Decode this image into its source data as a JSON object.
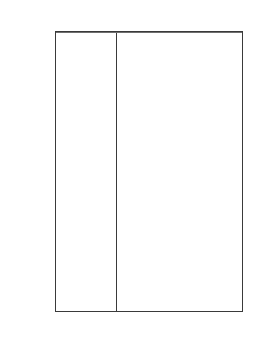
{
  "figure": {
    "top_artifact_text": "",
    "background_color": "#ffffff",
    "line_color": "#3a3a3a",
    "text_color": "#1a1a1a"
  },
  "axis": {
    "title": "Age  (million years)",
    "ticks": [
      {
        "label": "438",
        "value": 438
      },
      {
        "label": "505",
        "value": 505
      },
      {
        "label": "570",
        "value": 570
      }
    ],
    "range_top": 438,
    "range_bottom": 570,
    "direction": "increasing-downward"
  },
  "chart_data": {
    "type": "table",
    "title": "",
    "xlabel": "",
    "ylabel": "Age  (million years)",
    "ylim": [
      438,
      570
    ],
    "y_inverted": true,
    "grid": false,
    "legend": "none",
    "columns": [
      "Epoch",
      "Period"
    ],
    "periods": [
      {
        "name": "Ordovician",
        "top": 438,
        "bottom": 505
      },
      {
        "name": "Cambrian",
        "top": 505,
        "bottom": 570
      }
    ],
    "epochs": [
      {
        "name": "Late",
        "period": "Ordovician",
        "top": 438,
        "bottom": 471
      },
      {
        "name": "Middle",
        "period": "Ordovician",
        "top": 471,
        "bottom": 488
      },
      {
        "name": "Early",
        "period": "Ordovician",
        "top": 488,
        "bottom": 505
      },
      {
        "name": "Late",
        "period": "Cambrian",
        "top": 505,
        "bottom": 526
      },
      {
        "name": "Middle",
        "period": "Cambrian",
        "top": 526,
        "bottom": 550
      },
      {
        "name": "Early",
        "period": "Cambrian",
        "top": 550,
        "bottom": 570
      }
    ],
    "boundary_lines": [
      438,
      471,
      488,
      505,
      526,
      550,
      570
    ]
  }
}
